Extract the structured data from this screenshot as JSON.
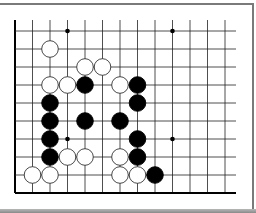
{
  "diagram": {
    "type": "go-board-fragment",
    "columns": 13,
    "rows": 10,
    "visible_edges": [
      "left",
      "bottom"
    ],
    "star_points": [
      {
        "col": 3,
        "row": 0
      },
      {
        "col": 9,
        "row": 0
      },
      {
        "col": 3,
        "row": 6
      },
      {
        "col": 9,
        "row": 6
      }
    ],
    "stones": [
      {
        "color": "white",
        "col": 2,
        "row": 1
      },
      {
        "color": "white",
        "col": 4,
        "row": 2
      },
      {
        "color": "white",
        "col": 5,
        "row": 2
      },
      {
        "color": "white",
        "col": 2,
        "row": 3
      },
      {
        "color": "white",
        "col": 3,
        "row": 3
      },
      {
        "color": "black",
        "col": 4,
        "row": 3
      },
      {
        "color": "white",
        "col": 6,
        "row": 3
      },
      {
        "color": "black",
        "col": 7,
        "row": 3
      },
      {
        "color": "black",
        "col": 2,
        "row": 4
      },
      {
        "color": "black",
        "col": 7,
        "row": 4
      },
      {
        "color": "black",
        "col": 2,
        "row": 5
      },
      {
        "color": "black",
        "col": 4,
        "row": 5
      },
      {
        "color": "black",
        "col": 6,
        "row": 5
      },
      {
        "color": "black",
        "col": 2,
        "row": 6
      },
      {
        "color": "black",
        "col": 7,
        "row": 6
      },
      {
        "color": "black",
        "col": 2,
        "row": 7
      },
      {
        "color": "white",
        "col": 3,
        "row": 7
      },
      {
        "color": "white",
        "col": 4,
        "row": 7
      },
      {
        "color": "white",
        "col": 6,
        "row": 7
      },
      {
        "color": "black",
        "col": 7,
        "row": 7
      },
      {
        "color": "white",
        "col": 1,
        "row": 8
      },
      {
        "color": "white",
        "col": 2,
        "row": 8
      },
      {
        "color": "white",
        "col": 6,
        "row": 8
      },
      {
        "color": "white",
        "col": 7,
        "row": 8
      },
      {
        "color": "black",
        "col": 8,
        "row": 8
      }
    ]
  },
  "colors": {
    "board": "#ffffff",
    "grid_line": "#222222",
    "edge_line": "#000000",
    "black_stone": "#000000",
    "white_stone_fill": "#ffffff",
    "white_stone_stroke": "#333333",
    "frame": "#7a7a7a"
  }
}
